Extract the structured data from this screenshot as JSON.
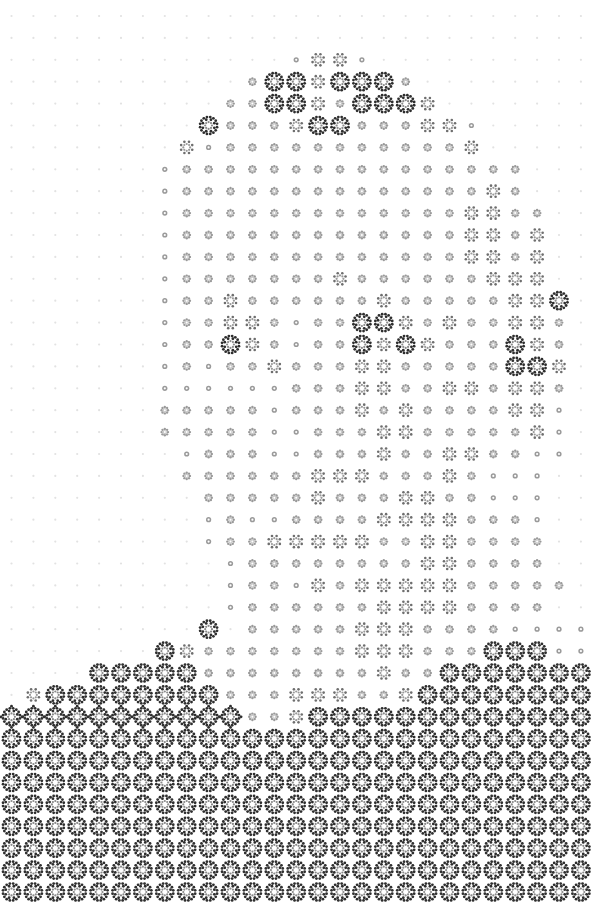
{
  "image": {
    "kind": "halftone-rosette-portrait",
    "width": 592,
    "height": 903,
    "background": "#ffffff",
    "grid": {
      "cols": 27,
      "rows": 41,
      "x0": 11.5,
      "y0": 16,
      "dx": 21.9,
      "dy": 21.9
    },
    "colors": {
      "faint": "#e2e2e2",
      "light": "#9a9a9a",
      "mid": "#6e6e6e",
      "dark": "#2e2e2e"
    },
    "legend_levels": [
      "faint-dot",
      "small-dot",
      "small-rosette",
      "medium-rosette",
      "large-rosette",
      "connected-rosette"
    ],
    "rows": [
      "000000000000000000000000000",
      "000000000000000000000000000",
      "000000000000013310000000000",
      "000000000002443444200000000",
      "000000000022443244430000000",
      "000000000422234422233100000",
      "000000003122222222222300000",
      "000000012222222222222222000",
      "000000012222222222222232000",
      "000000012222222222222332200",
      "000000012222222222222332300",
      "000000012222222222222332300",
      "000000012222222322222233300",
      "000000012232222223222223340",
      "000000012233212244323223320",
      "000000012243212243432224320",
      "000000012122322233222224430",
      "000000011111122233223323320",
      "000000022222122232322223310",
      "000000022222112223322222310",
      "000000001222112223223322110",
      "000000002222223332223211100",
      "000000000222223222332211100",
      "000000000121122223333222100",
      "000000000122333332233222200",
      "000000000012222222233222200",
      "000000000012213233333222220",
      "000000000012222223333222200",
      "000000000402222233322221111",
      "000000043222222233322244411",
      "000044444222222223224444444",
      "034444444422233322344444444",
      "555555555552234444444444444",
      "444444444444444444444444444",
      "444444444444444444444444444",
      "444444444444444444444444444",
      "444444444444444444444444444",
      "444444444444444444444444444",
      "444444444444444444444444444",
      "444444444444444444444444444",
      "444444444444444444444444444"
    ]
  }
}
